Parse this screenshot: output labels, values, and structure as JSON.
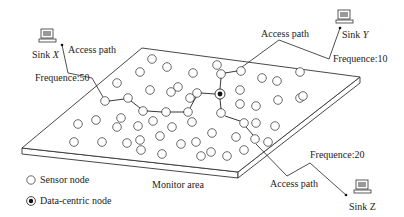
{
  "diagram": {
    "type": "wireless-sensor-network",
    "monitor_area_label": "Monitor area",
    "sinks": [
      {
        "id": "x",
        "label_prefix": "Sink ",
        "label_var": "X",
        "access_label": "Access path",
        "frequency_label": "Frequence:50"
      },
      {
        "id": "y",
        "label_prefix": "Sink ",
        "label_var": "Y",
        "access_label": "Access path",
        "frequency_label": "Frequence:10"
      },
      {
        "id": "z",
        "label_prefix": "Sink ",
        "label_var": "Z",
        "access_label": "Access path",
        "frequency_label": "Frequence:20"
      }
    ],
    "legend": {
      "sensor_node": "Sensor node",
      "data_centric_node": "Data-centric node"
    },
    "colors": {
      "line": "#222222",
      "node_stroke": "#444444",
      "background": "#ffffff"
    }
  }
}
